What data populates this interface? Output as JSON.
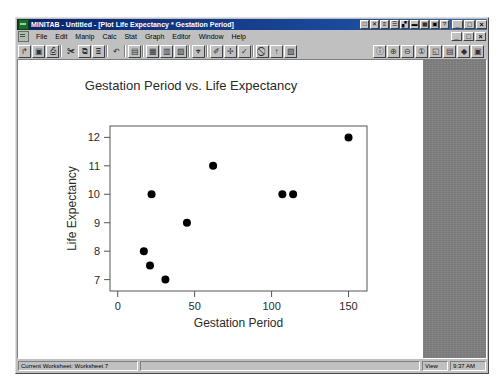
{
  "window": {
    "title": "MINITAB - Untitled - [Plot Life Expectancy * Gestation Period]",
    "app_icon": "minitab-icon",
    "buttons": {
      "minimize": "_",
      "maximize": "□",
      "close": "×",
      "child_minimize": "_",
      "child_restore": "□",
      "child_close": "×"
    }
  },
  "menu": {
    "items": [
      {
        "label": "File"
      },
      {
        "label": "Edit"
      },
      {
        "label": "Manip"
      },
      {
        "label": "Calc"
      },
      {
        "label": "Stat"
      },
      {
        "label": "Graph"
      },
      {
        "label": "Editor"
      },
      {
        "label": "Window"
      },
      {
        "label": "Help"
      }
    ]
  },
  "toolbar": {
    "left_buttons": [
      {
        "name": "open-icon",
        "glyph": "↱"
      },
      {
        "name": "save-icon",
        "glyph": "▣"
      },
      {
        "name": "print-icon",
        "glyph": "⎙"
      },
      {
        "name": "cut-icon",
        "glyph": "✀"
      },
      {
        "name": "copy-icon",
        "glyph": "⧉"
      },
      {
        "name": "paste-icon",
        "glyph": "⌸"
      },
      {
        "name": "undo-icon",
        "glyph": "↶"
      },
      {
        "name": "session-icon",
        "glyph": "▤"
      },
      {
        "name": "worksheet-icon",
        "glyph": "▦"
      },
      {
        "name": "history-icon",
        "glyph": "▥"
      },
      {
        "name": "project-manager-icon",
        "glyph": "▧"
      },
      {
        "name": "find-icon",
        "glyph": "⌖"
      },
      {
        "name": "brush-icon",
        "glyph": "✐"
      },
      {
        "name": "crosshair-icon",
        "glyph": "✢"
      },
      {
        "name": "edit-last-icon",
        "glyph": "✓"
      },
      {
        "name": "cancel-icon",
        "glyph": "⃠"
      },
      {
        "name": "up-icon",
        "glyph": "↑"
      },
      {
        "name": "graph-icon",
        "glyph": "▨"
      }
    ],
    "right_buttons": [
      {
        "name": "annotate-icon",
        "glyph": "ⓘ"
      },
      {
        "name": "zoom-in-icon",
        "glyph": "⊕"
      },
      {
        "name": "zoom-out-icon",
        "glyph": "⊖"
      },
      {
        "name": "info-icon",
        "glyph": "①"
      },
      {
        "name": "select-icon",
        "glyph": "◱"
      },
      {
        "name": "layout-icon",
        "glyph": "▤"
      },
      {
        "name": "marker-icon",
        "glyph": "◆"
      },
      {
        "name": "palette-icon",
        "glyph": "▣"
      }
    ],
    "title_buttons": [
      {
        "name": "new-project-icon",
        "glyph": "□"
      },
      {
        "name": "close-graph-icon",
        "glyph": "✕"
      },
      {
        "name": "tile-icon",
        "glyph": "≡"
      },
      {
        "name": "cascade-icon",
        "glyph": "☰"
      },
      {
        "name": "arrange-icon",
        "glyph": "▞"
      },
      {
        "name": "minimize-all-icon",
        "glyph": "▬"
      },
      {
        "name": "data-window-icon",
        "glyph": "▦"
      },
      {
        "name": "graph-window-icon",
        "glyph": "▣"
      },
      {
        "name": "help-icon",
        "glyph": "?"
      }
    ]
  },
  "status": {
    "current_worksheet": "Current Worksheet: Worksheet 7",
    "middle": "",
    "view_label": "View",
    "time": "9:37 AM"
  },
  "chart_data": {
    "type": "scatter",
    "title": "Gestation Period vs. Life Expectancy",
    "xlabel": "Gestation Period",
    "ylabel": "Life Expectancy",
    "xlim": [
      -5,
      162
    ],
    "ylim": [
      6.6,
      12.4
    ],
    "xticks": [
      0,
      50,
      100,
      150
    ],
    "yticks": [
      7,
      8,
      9,
      10,
      11,
      12
    ],
    "grid": false,
    "legend": null,
    "marker": {
      "shape": "circle",
      "color": "#000000",
      "size": 4
    },
    "points": [
      {
        "x": 17,
        "y": 8
      },
      {
        "x": 21,
        "y": 7.5
      },
      {
        "x": 22,
        "y": 10
      },
      {
        "x": 31,
        "y": 7
      },
      {
        "x": 45,
        "y": 9
      },
      {
        "x": 62,
        "y": 11
      },
      {
        "x": 107,
        "y": 10
      },
      {
        "x": 114,
        "y": 10
      },
      {
        "x": 150,
        "y": 12
      }
    ]
  },
  "colors": {
    "title_bar": "#0a246a",
    "window_face": "#c0c0c0",
    "workspace": "#808080",
    "plot_bg": "#ffffff",
    "axis": "#555555",
    "text": "#2a2a2a"
  }
}
